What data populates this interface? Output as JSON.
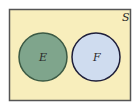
{
  "diagram": {
    "type": "venn",
    "universe": {
      "label": "S",
      "fill": "#f8eebc",
      "stroke": "#555555"
    },
    "sets": [
      {
        "label": "E",
        "fill": "#7fa58c",
        "stroke": "#3c5a44"
      },
      {
        "label": "F",
        "fill": "#cfdcef",
        "stroke": "#1e1e3a"
      }
    ],
    "relationship": "disjoint"
  }
}
